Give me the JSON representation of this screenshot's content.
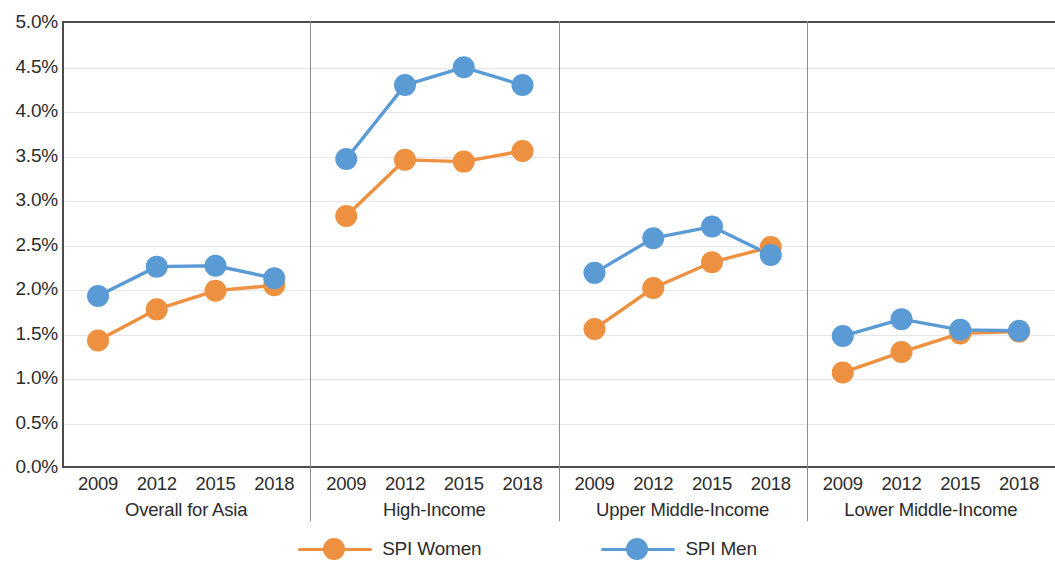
{
  "chart_data": {
    "type": "line",
    "title": "",
    "subtitle": "",
    "xlabel": "",
    "ylabel": "",
    "ylim": [
      0,
      5
    ],
    "ytick_format": "percent",
    "yticks": [
      "0.0%",
      "0.5%",
      "1.0%",
      "1.5%",
      "2.0%",
      "2.5%",
      "3.0%",
      "3.5%",
      "4.0%",
      "4.5%",
      "5.0%"
    ],
    "ytick_values": [
      0,
      0.5,
      1.0,
      1.5,
      2.0,
      2.5,
      3.0,
      3.5,
      4.0,
      4.5,
      5.0
    ],
    "grid": true,
    "grid_axis": "y",
    "legend_position": "bottom-center",
    "x": [
      "2009",
      "2012",
      "2015",
      "2018"
    ],
    "panels": [
      {
        "label": "Overall for Asia",
        "categories": [
          "2009",
          "2012",
          "2015",
          "2018"
        ],
        "series": [
          {
            "name": "SPI Women",
            "color": "#ED9140",
            "values": [
              1.41,
              1.76,
              1.97,
              2.03
            ]
          },
          {
            "name": "SPI Men",
            "color": "#5B9BD5",
            "values": [
              1.91,
              2.24,
              2.25,
              2.11
            ]
          }
        ]
      },
      {
        "label": "High-Income",
        "categories": [
          "2009",
          "2012",
          "2015",
          "2018"
        ],
        "series": [
          {
            "name": "SPI Women",
            "color": "#ED9140",
            "values": [
              2.81,
              3.44,
              3.42,
              3.54
            ]
          },
          {
            "name": "SPI Men",
            "color": "#5B9BD5",
            "values": [
              3.45,
              4.28,
              4.48,
              4.28
            ]
          }
        ]
      },
      {
        "label": "Upper Middle-Income",
        "categories": [
          "2009",
          "2012",
          "2015",
          "2018"
        ],
        "series": [
          {
            "name": "SPI Women",
            "color": "#ED9140",
            "values": [
              1.54,
              2.0,
              2.29,
              2.46
            ]
          },
          {
            "name": "SPI Men",
            "color": "#5B9BD5",
            "values": [
              2.17,
              2.56,
              2.69,
              2.37
            ]
          }
        ]
      },
      {
        "label": "Lower Middle-Income",
        "categories": [
          "2009",
          "2012",
          "2015",
          "2018"
        ],
        "series": [
          {
            "name": "SPI Women",
            "color": "#ED9140",
            "values": [
              1.05,
              1.28,
              1.49,
              1.51
            ]
          },
          {
            "name": "SPI Men",
            "color": "#5B9BD5",
            "values": [
              1.46,
              1.65,
              1.53,
              1.52
            ]
          }
        ]
      }
    ],
    "legend": [
      {
        "name": "SPI Women",
        "color": "#ED9140"
      },
      {
        "name": "SPI Men",
        "color": "#5B9BD5"
      }
    ]
  },
  "colors": {
    "women": "#ED9140",
    "men": "#5B9BD5",
    "axis": "#4c4c4c",
    "grid": "#e8e3e8",
    "separator": "#8d8d8d",
    "text": "#2c2c2c"
  }
}
